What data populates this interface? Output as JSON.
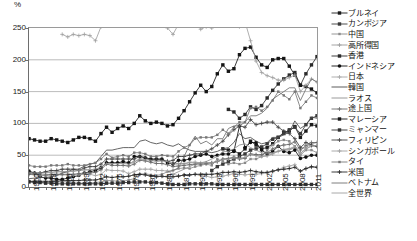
{
  "chart": {
    "type": "line",
    "unit_label": "%",
    "y_ticks": [
      "0",
      "50",
      "100",
      "150",
      "200",
      "250"
    ],
    "x_ticks": [
      "1960",
      "1963",
      "1966",
      "1969",
      "1972",
      "1975",
      "1978",
      "1981",
      "1984",
      "1987",
      "1990",
      "1993",
      "1996",
      "1999",
      "2002",
      "2005",
      "2008",
      "2011"
    ]
  },
  "legend": {
    "items": [
      {
        "label": "ブルネイ",
        "marker": "square-filled",
        "color": "#1a1a1a",
        "dash": "none"
      },
      {
        "label": "カンボジア",
        "marker": "square-filled",
        "color": "#3a3a3a",
        "dash": "none"
      },
      {
        "label": "中国",
        "marker": "square-small",
        "color": "#8a8a8a",
        "dash": "none"
      },
      {
        "label": "高所得国",
        "marker": "plus",
        "color": "#9a9a9a",
        "dash": "none"
      },
      {
        "label": "香港",
        "marker": "square-filled",
        "color": "#2a2a2a",
        "dash": "none"
      },
      {
        "label": "インドネシア",
        "marker": "circle-filled",
        "color": "#111111",
        "dash": "none"
      },
      {
        "label": "日本",
        "marker": "plus",
        "color": "#a5a5a5",
        "dash": "none"
      },
      {
        "label": "韓国",
        "marker": "none",
        "color": "#4a4a4a",
        "dash": "none"
      },
      {
        "label": "ラオス",
        "marker": "none",
        "color": "#8f8f8f",
        "dash": "none"
      },
      {
        "label": "途上国",
        "marker": "plus",
        "color": "#6a6a6a",
        "dash": "none"
      },
      {
        "label": "マレーシア",
        "marker": "square-filled",
        "color": "#151515",
        "dash": "none"
      },
      {
        "label": "ミャンマー",
        "marker": "square-filled",
        "color": "#303030",
        "dash": "none"
      },
      {
        "label": "フィリピン",
        "marker": "plus",
        "color": "#3f3f3f",
        "dash": "none"
      },
      {
        "label": "シンガポール",
        "marker": "plus",
        "color": "#a0a0a0",
        "dash": "none"
      },
      {
        "label": "タイ",
        "marker": "square-small",
        "color": "#787878",
        "dash": "none"
      },
      {
        "label": "米国",
        "marker": "plus",
        "color": "#262626",
        "dash": "none"
      },
      {
        "label": "ベトナム",
        "marker": "none",
        "color": "#6f6f6f",
        "dash": "none"
      },
      {
        "label": "全世界",
        "marker": "none",
        "color": "#9e9e9e",
        "dash": "none"
      }
    ]
  },
  "chart_data": {
    "type": "line",
    "title": "",
    "xlabel": "",
    "ylabel": "%",
    "ylim": [
      0,
      250
    ],
    "xlim": [
      1960,
      2012
    ],
    "grid": "horizontal",
    "legend_position": "right",
    "x": [
      1960,
      1961,
      1962,
      1963,
      1964,
      1965,
      1966,
      1967,
      1968,
      1969,
      1970,
      1971,
      1972,
      1973,
      1974,
      1975,
      1976,
      1977,
      1978,
      1979,
      1980,
      1981,
      1982,
      1983,
      1984,
      1985,
      1986,
      1987,
      1988,
      1989,
      1990,
      1991,
      1992,
      1993,
      1994,
      1995,
      1996,
      1997,
      1998,
      1999,
      2000,
      2001,
      2002,
      2003,
      2004,
      2005,
      2006,
      2007,
      2008,
      2009,
      2010,
      2011,
      2012
    ],
    "series": [
      {
        "name": "ブルネイ",
        "marker": "square-filled",
        "color": "#1a1a1a",
        "values": [
          null,
          null,
          null,
          null,
          null,
          null,
          null,
          null,
          null,
          null,
          null,
          null,
          null,
          null,
          null,
          null,
          null,
          null,
          null,
          null,
          null,
          null,
          null,
          null,
          null,
          null,
          null,
          null,
          null,
          null,
          null,
          null,
          null,
          null,
          null,
          60,
          58,
          57,
          52,
          60,
          72,
          66,
          60,
          62,
          68,
          78,
          86,
          88,
          95,
          78,
          88,
          98,
          96
        ]
      },
      {
        "name": "カンボジア",
        "marker": "square-filled",
        "color": "#3a3a3a",
        "values": [
          null,
          null,
          null,
          null,
          null,
          null,
          null,
          null,
          null,
          null,
          null,
          null,
          null,
          null,
          null,
          null,
          null,
          null,
          null,
          null,
          null,
          null,
          null,
          null,
          null,
          null,
          null,
          null,
          null,
          null,
          null,
          null,
          null,
          26,
          32,
          36,
          40,
          44,
          48,
          52,
          58,
          60,
          63,
          68,
          75,
          78,
          84,
          90,
          94,
          84,
          98,
          108,
          112
        ]
      },
      {
        "name": "中国",
        "marker": "square-small",
        "color": "#8a8a8a",
        "values": [
          9,
          8,
          7,
          7,
          7,
          8,
          8,
          8,
          7,
          6,
          6,
          6,
          7,
          8,
          10,
          10,
          9,
          9,
          11,
          13,
          20,
          21,
          19,
          18,
          20,
          24,
          26,
          29,
          30,
          29,
          32,
          34,
          36,
          34,
          44,
          40,
          36,
          38,
          36,
          38,
          44,
          44,
          48,
          58,
          66,
          72,
          74,
          72,
          64,
          50,
          58,
          58,
          54
        ]
      },
      {
        "name": "高所得国",
        "marker": "plus",
        "color": "#9a9a9a",
        "values": [
          22,
          22,
          22,
          23,
          23,
          24,
          24,
          24,
          25,
          26,
          27,
          27,
          28,
          31,
          38,
          37,
          38,
          38,
          37,
          40,
          44,
          44,
          43,
          41,
          43,
          41,
          37,
          37,
          37,
          39,
          39,
          38,
          38,
          38,
          40,
          43,
          44,
          46,
          45,
          46,
          51,
          50,
          48,
          49,
          52,
          56,
          59,
          60,
          62,
          53,
          60,
          64,
          64
        ]
      },
      {
        "name": "香港",
        "marker": "square-filled",
        "color": "#2a2a2a",
        "values": [
          null,
          null,
          null,
          null,
          null,
          null,
          null,
          null,
          null,
          null,
          null,
          null,
          null,
          null,
          null,
          null,
          null,
          null,
          null,
          null,
          null,
          null,
          null,
          null,
          null,
          null,
          null,
          null,
          null,
          null,
          null,
          null,
          null,
          null,
          null,
          null,
          122,
          118,
          108,
          114,
          126,
          122,
          128,
          140,
          152,
          162,
          170,
          176,
          180,
          160,
          178,
          192,
          205
        ]
      },
      {
        "name": "インドネシア",
        "marker": "circle-filled",
        "color": "#111111",
        "values": [
          25,
          22,
          16,
          14,
          14,
          12,
          12,
          14,
          16,
          18,
          22,
          24,
          26,
          30,
          38,
          38,
          38,
          40,
          38,
          48,
          48,
          46,
          44,
          44,
          44,
          38,
          36,
          42,
          42,
          44,
          48,
          50,
          52,
          48,
          50,
          52,
          52,
          56,
          96,
          62,
          70,
          70,
          58,
          52,
          56,
          64,
          56,
          54,
          58,
          45,
          47,
          50,
          50
        ]
      },
      {
        "name": "日本",
        "marker": "plus",
        "color": "#a5a5a5",
        "values": [
          20,
          19,
          18,
          18,
          18,
          19,
          19,
          19,
          19,
          19,
          20,
          20,
          18,
          20,
          27,
          26,
          26,
          25,
          21,
          24,
          28,
          28,
          28,
          26,
          26,
          25,
          20,
          18,
          18,
          19,
          20,
          18,
          17,
          15,
          16,
          17,
          19,
          21,
          20,
          19,
          20,
          20,
          21,
          22,
          24,
          27,
          31,
          33,
          35,
          25,
          29,
          31,
          31
        ]
      },
      {
        "name": "韓国",
        "marker": "none",
        "color": "#4a4a4a",
        "values": [
          13,
          14,
          15,
          15,
          16,
          18,
          22,
          24,
          28,
          28,
          33,
          36,
          38,
          48,
          58,
          58,
          60,
          62,
          62,
          62,
          72,
          74,
          70,
          68,
          70,
          66,
          64,
          68,
          62,
          58,
          56,
          56,
          56,
          54,
          56,
          60,
          62,
          70,
          84,
          76,
          78,
          72,
          68,
          70,
          78,
          78,
          82,
          86,
          104,
          92,
          98,
          110,
          108
        ]
      },
      {
        "name": "ラオス",
        "marker": "none",
        "color": "#8f8f8f",
        "values": [
          null,
          null,
          null,
          null,
          null,
          null,
          null,
          null,
          null,
          null,
          null,
          null,
          null,
          null,
          null,
          null,
          null,
          null,
          null,
          null,
          null,
          null,
          null,
          null,
          15,
          18,
          20,
          24,
          28,
          32,
          36,
          38,
          40,
          44,
          48,
          56,
          56,
          60,
          66,
          68,
          62,
          58,
          54,
          52,
          54,
          56,
          58,
          58,
          62,
          60,
          62,
          68,
          70
        ]
      },
      {
        "name": "途上国",
        "marker": "plus",
        "color": "#6a6a6a",
        "values": [
          20,
          20,
          19,
          19,
          20,
          20,
          20,
          20,
          20,
          21,
          22,
          22,
          23,
          27,
          36,
          34,
          34,
          34,
          33,
          36,
          42,
          41,
          39,
          37,
          37,
          35,
          32,
          33,
          34,
          35,
          36,
          36,
          37,
          38,
          40,
          44,
          45,
          47,
          44,
          45,
          52,
          51,
          51,
          54,
          60,
          64,
          66,
          67,
          71,
          58,
          65,
          70,
          70
        ]
      },
      {
        "name": "マレーシア",
        "marker": "square-filled",
        "color": "#151515",
        "values": [
          76,
          74,
          72,
          72,
          76,
          74,
          72,
          70,
          74,
          78,
          78,
          76,
          72,
          84,
          94,
          86,
          92,
          96,
          92,
          100,
          112,
          104,
          100,
          102,
          100,
          96,
          98,
          108,
          120,
          134,
          148,
          160,
          150,
          158,
          178,
          192,
          182,
          186,
          208,
          218,
          220,
          204,
          192,
          188,
          200,
          202,
          202,
          190,
          176,
          160,
          158,
          154,
          148
        ]
      },
      {
        "name": "ミャンマー",
        "marker": "square-filled",
        "color": "#303030",
        "values": [
          8,
          7,
          7,
          6,
          6,
          5,
          5,
          5,
          5,
          5,
          5,
          5,
          5,
          5,
          6,
          6,
          6,
          7,
          7,
          8,
          8,
          8,
          7,
          7,
          6,
          5,
          4,
          4,
          4,
          5,
          5,
          5,
          5,
          5,
          4,
          4,
          4,
          4,
          4,
          4,
          4,
          4,
          4,
          4,
          4,
          4,
          4,
          4,
          4,
          4,
          4,
          4,
          4
        ]
      },
      {
        "name": "フィリピン",
        "marker": "plus",
        "color": "#3f3f3f",
        "values": [
          22,
          22,
          22,
          24,
          26,
          26,
          28,
          28,
          28,
          26,
          30,
          32,
          32,
          36,
          44,
          44,
          44,
          44,
          44,
          44,
          48,
          46,
          42,
          44,
          42,
          40,
          42,
          48,
          48,
          50,
          52,
          52,
          56,
          60,
          66,
          72,
          82,
          90,
          96,
          94,
          106,
          98,
          100,
          102,
          102,
          94,
          88,
          84,
          76,
          62,
          70,
          66,
          64
        ]
      },
      {
        "name": "シンガポール",
        "marker": "plus",
        "color": "#a0a0a0",
        "values": [
          null,
          null,
          null,
          null,
          null,
          null,
          240,
          236,
          240,
          238,
          240,
          238,
          230,
          252,
          280,
          258,
          264,
          272,
          282,
          294,
          300,
          286,
          274,
          264,
          260,
          250,
          240,
          256,
          264,
          268,
          260,
          248,
          252,
          250,
          262,
          268,
          266,
          264,
          252,
          260,
          230,
          198,
          180,
          175,
          172,
          168,
          168,
          172,
          176,
          150,
          160,
          170,
          165
        ]
      },
      {
        "name": "タイ",
        "marker": "square-small",
        "color": "#787878",
        "values": [
          34,
          32,
          32,
          32,
          34,
          34,
          34,
          36,
          34,
          34,
          34,
          36,
          38,
          44,
          52,
          46,
          48,
          50,
          48,
          54,
          54,
          52,
          48,
          48,
          50,
          49,
          48,
          56,
          62,
          66,
          76,
          78,
          78,
          78,
          82,
          90,
          84,
          94,
          102,
          102,
          124,
          126,
          120,
          126,
          136,
          150,
          144,
          138,
          150,
          124,
          134,
          144,
          140
        ]
      },
      {
        "name": "米国",
        "marker": "plus",
        "color": "#262626",
        "values": [
          9,
          9,
          9,
          9,
          9,
          9,
          10,
          10,
          10,
          10,
          11,
          11,
          11,
          13,
          16,
          15,
          16,
          16,
          17,
          19,
          20,
          19,
          17,
          16,
          17,
          16,
          16,
          17,
          19,
          19,
          20,
          20,
          20,
          20,
          21,
          23,
          23,
          24,
          23,
          24,
          26,
          24,
          23,
          23,
          25,
          27,
          28,
          29,
          31,
          25,
          29,
          32,
          31
        ]
      },
      {
        "name": "ベトナム",
        "marker": "none",
        "color": "#6f6f6f",
        "values": [
          null,
          null,
          null,
          null,
          null,
          null,
          null,
          null,
          null,
          null,
          null,
          null,
          null,
          null,
          null,
          null,
          null,
          null,
          null,
          null,
          null,
          null,
          null,
          null,
          null,
          24,
          26,
          30,
          48,
          66,
          80,
          68,
          72,
          66,
          76,
          76,
          92,
          96,
          96,
          102,
          112,
          112,
          116,
          124,
          138,
          144,
          150,
          156,
          156,
          136,
          154,
          170,
          165
        ]
      },
      {
        "name": "全世界",
        "marker": "none",
        "color": "#9e9e9e",
        "values": [
          22,
          22,
          22,
          22,
          23,
          24,
          24,
          24,
          25,
          26,
          27,
          27,
          28,
          31,
          37,
          37,
          37,
          37,
          36,
          39,
          44,
          43,
          42,
          40,
          41,
          40,
          36,
          36,
          36,
          38,
          38,
          38,
          38,
          38,
          40,
          43,
          44,
          46,
          45,
          46,
          51,
          49,
          48,
          49,
          53,
          57,
          59,
          60,
          64,
          53,
          60,
          65,
          65
        ]
      }
    ]
  }
}
